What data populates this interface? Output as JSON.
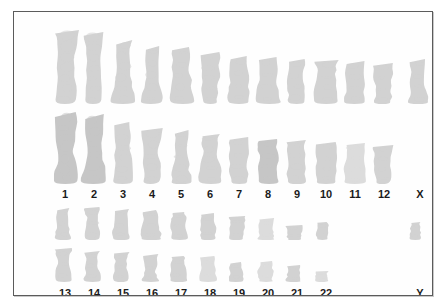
{
  "figure": {
    "name": "human-karyotype",
    "type": "karyogram",
    "plate_background": "#fefefe",
    "frame_color": "#5b5b5b",
    "chromosome_color": "#d2d2d2",
    "label_color": "#1b1b1b"
  },
  "labels": {
    "row_top": [
      {
        "text": "1",
        "x": 40
      },
      {
        "text": "2",
        "x": 69
      },
      {
        "text": "3",
        "x": 98
      },
      {
        "text": "4",
        "x": 127
      },
      {
        "text": "5",
        "x": 156
      },
      {
        "text": "6",
        "x": 185
      },
      {
        "text": "7",
        "x": 214
      },
      {
        "text": "8",
        "x": 243
      },
      {
        "text": "9",
        "x": 272
      },
      {
        "text": "10",
        "x": 301
      },
      {
        "text": "11",
        "x": 330
      },
      {
        "text": "12",
        "x": 359
      },
      {
        "text": "X",
        "x": 395
      }
    ],
    "row_bottom": [
      {
        "text": "13",
        "x": 40
      },
      {
        "text": "14",
        "x": 69
      },
      {
        "text": "15",
        "x": 98
      },
      {
        "text": "16",
        "x": 127
      },
      {
        "text": "17",
        "x": 156
      },
      {
        "text": "18",
        "x": 185
      },
      {
        "text": "19",
        "x": 214
      },
      {
        "text": "20",
        "x": 243
      },
      {
        "text": "21",
        "x": 272
      },
      {
        "text": "22",
        "x": 301
      },
      {
        "text": "Y",
        "x": 395
      }
    ]
  },
  "rows": {
    "row1": [
      {
        "label": "1",
        "x": 40,
        "w": 24,
        "h": 74,
        "shade": "normal"
      },
      {
        "label": "2",
        "x": 69,
        "w": 22,
        "h": 72,
        "shade": "normal"
      },
      {
        "label": "3",
        "x": 98,
        "w": 22,
        "h": 64,
        "shade": "normal"
      },
      {
        "label": "4",
        "x": 127,
        "w": 22,
        "h": 58,
        "shade": "normal"
      },
      {
        "label": "5",
        "x": 156,
        "w": 22,
        "h": 57,
        "shade": "normal"
      },
      {
        "label": "6",
        "x": 185,
        "w": 22,
        "h": 52,
        "shade": "normal"
      },
      {
        "label": "7",
        "x": 214,
        "w": 22,
        "h": 48,
        "shade": "normal"
      },
      {
        "label": "8",
        "x": 243,
        "w": 22,
        "h": 47,
        "shade": "normal"
      },
      {
        "label": "9",
        "x": 272,
        "w": 20,
        "h": 45,
        "shade": "normal"
      },
      {
        "label": "10",
        "x": 301,
        "w": 22,
        "h": 44,
        "shade": "normal"
      },
      {
        "label": "11",
        "x": 330,
        "w": 22,
        "h": 43,
        "shade": "normal"
      },
      {
        "label": "12",
        "x": 359,
        "w": 20,
        "h": 41,
        "shade": "normal"
      },
      {
        "label": "X",
        "x": 395,
        "w": 18,
        "h": 45,
        "shade": "normal"
      }
    ],
    "row2": [
      {
        "label": "1",
        "x": 40,
        "w": 24,
        "h": 72,
        "shade": "dense"
      },
      {
        "label": "2",
        "x": 69,
        "w": 22,
        "h": 70,
        "shade": "dense"
      },
      {
        "label": "3",
        "x": 98,
        "w": 22,
        "h": 62,
        "shade": "normal"
      },
      {
        "label": "4",
        "x": 127,
        "w": 22,
        "h": 56,
        "shade": "normal"
      },
      {
        "label": "5",
        "x": 156,
        "w": 22,
        "h": 54,
        "shade": "normal"
      },
      {
        "label": "6",
        "x": 185,
        "w": 22,
        "h": 50,
        "shade": "normal"
      },
      {
        "label": "7",
        "x": 214,
        "w": 22,
        "h": 47,
        "shade": "normal"
      },
      {
        "label": "8",
        "x": 243,
        "w": 22,
        "h": 45,
        "shade": "dense"
      },
      {
        "label": "9",
        "x": 272,
        "w": 20,
        "h": 44,
        "shade": "normal"
      },
      {
        "label": "10",
        "x": 301,
        "w": 22,
        "h": 42,
        "shade": "normal"
      },
      {
        "label": "11",
        "x": 330,
        "w": 22,
        "h": 41,
        "shade": "faint"
      },
      {
        "label": "12",
        "x": 359,
        "w": 20,
        "h": 39,
        "shade": "normal"
      }
    ],
    "row3": [
      {
        "label": "13",
        "x": 40,
        "w": 18,
        "h": 32,
        "shade": "normal"
      },
      {
        "label": "14",
        "x": 69,
        "w": 18,
        "h": 33,
        "shade": "normal"
      },
      {
        "label": "15",
        "x": 98,
        "w": 18,
        "h": 31,
        "shade": "normal"
      },
      {
        "label": "16",
        "x": 127,
        "w": 20,
        "h": 30,
        "shade": "normal"
      },
      {
        "label": "17",
        "x": 156,
        "w": 18,
        "h": 28,
        "shade": "normal"
      },
      {
        "label": "18",
        "x": 185,
        "w": 18,
        "h": 27,
        "shade": "normal"
      },
      {
        "label": "19",
        "x": 214,
        "w": 18,
        "h": 24,
        "shade": "normal"
      },
      {
        "label": "20",
        "x": 243,
        "w": 18,
        "h": 22,
        "shade": "faint"
      },
      {
        "label": "21",
        "x": 272,
        "w": 16,
        "h": 15,
        "shade": "normal"
      },
      {
        "label": "22",
        "x": 301,
        "w": 15,
        "h": 18,
        "shade": "normal"
      },
      {
        "label": "Y",
        "x": 395,
        "w": 13,
        "h": 18,
        "shade": "normal"
      }
    ],
    "row4": [
      {
        "label": "13",
        "x": 40,
        "w": 18,
        "h": 34,
        "shade": "normal"
      },
      {
        "label": "14",
        "x": 69,
        "w": 18,
        "h": 31,
        "shade": "normal"
      },
      {
        "label": "15",
        "x": 98,
        "w": 18,
        "h": 30,
        "shade": "normal"
      },
      {
        "label": "16",
        "x": 127,
        "w": 18,
        "h": 28,
        "shade": "normal"
      },
      {
        "label": "17",
        "x": 156,
        "w": 16,
        "h": 26,
        "shade": "normal"
      },
      {
        "label": "18",
        "x": 185,
        "w": 18,
        "h": 26,
        "shade": "faint"
      },
      {
        "label": "19",
        "x": 214,
        "w": 16,
        "h": 20,
        "shade": "normal"
      },
      {
        "label": "20",
        "x": 243,
        "w": 18,
        "h": 21,
        "shade": "faint"
      },
      {
        "label": "21",
        "x": 272,
        "w": 15,
        "h": 17,
        "shade": "normal"
      },
      {
        "label": "22",
        "x": 301,
        "w": 13,
        "h": 11,
        "shade": "faint"
      }
    ]
  },
  "chart_data": {
    "type": "table",
    "categories": [
      "1",
      "2",
      "3",
      "4",
      "5",
      "6",
      "7",
      "8",
      "9",
      "10",
      "11",
      "12",
      "X",
      "13",
      "14",
      "15",
      "16",
      "17",
      "18",
      "19",
      "20",
      "21",
      "22",
      "Y"
    ],
    "counts_per_column": [
      2,
      2,
      2,
      2,
      2,
      2,
      2,
      2,
      2,
      2,
      2,
      2,
      1,
      2,
      2,
      2,
      2,
      2,
      2,
      2,
      2,
      2,
      2,
      1
    ],
    "banks": [
      {
        "name": "upper-bank",
        "labels": [
          "1",
          "2",
          "3",
          "4",
          "5",
          "6",
          "7",
          "8",
          "9",
          "10",
          "11",
          "12",
          "X"
        ],
        "rows": 2
      },
      {
        "name": "lower-bank",
        "labels": [
          "13",
          "14",
          "15",
          "16",
          "17",
          "18",
          "19",
          "20",
          "21",
          "22",
          "Y"
        ],
        "rows": 2
      }
    ],
    "xlabel": "Chromosome",
    "ylabel": "",
    "grid": false,
    "legend": "none"
  }
}
